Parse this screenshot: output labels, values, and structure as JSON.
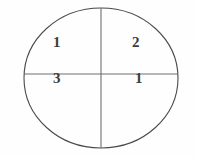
{
  "figure": {
    "type": "quadrant-circle-diagram",
    "background_color": "#fefefe",
    "stroke_color": "#4a4a4a",
    "label_color": "#3c3c3c",
    "shape": {
      "name": "ellipse",
      "center_x": 101,
      "center_y": 78,
      "radius_x": 77,
      "radius_y": 70
    },
    "dividers": [
      {
        "name": "vertical-diameter",
        "x1": 101,
        "y1": 8,
        "x2": 101,
        "y2": 148
      },
      {
        "name": "horizontal-diameter",
        "x1": 24,
        "y1": 74,
        "x2": 178,
        "y2": 74
      }
    ],
    "labels": {
      "upper_left": "1",
      "upper_right": "2",
      "lower_left": "3",
      "lower_right": "1"
    }
  }
}
